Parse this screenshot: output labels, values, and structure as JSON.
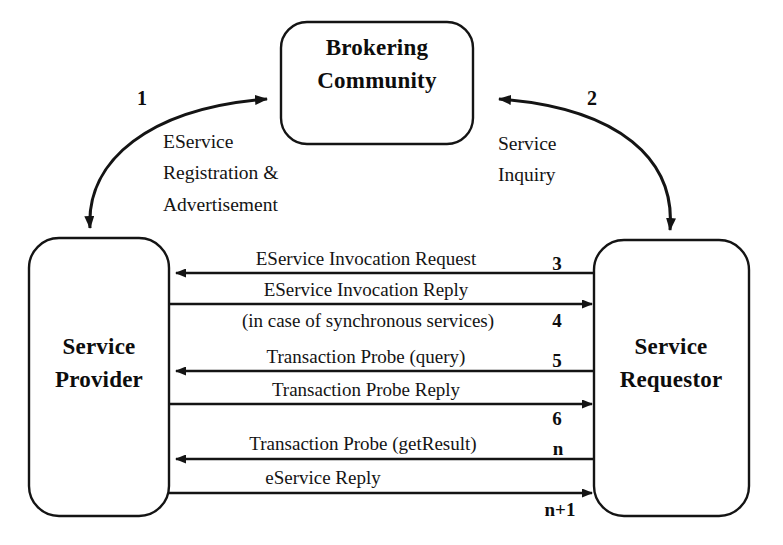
{
  "diagram": {
    "nodes": [
      {
        "id": "broker",
        "label_line1": "Brokering",
        "label_line2": "Community"
      },
      {
        "id": "provider",
        "label_line1": "Service",
        "label_line2": "Provider"
      },
      {
        "id": "requestor",
        "label_line1": "Service",
        "label_line2": "Requestor"
      }
    ],
    "curved_flows": [
      {
        "id": "registration",
        "number": "1",
        "label_lines": [
          "EService",
          "Registration &",
          "Advertisement"
        ],
        "from": "provider",
        "to": "broker",
        "double_headed": true
      },
      {
        "id": "inquiry",
        "number": "2",
        "label_lines": [
          "Service",
          "Inquiry"
        ],
        "from": "requestor",
        "to": "broker",
        "double_headed": true
      }
    ],
    "messages": [
      {
        "number": "3",
        "label": "EService Invocation Request",
        "sublabel": "",
        "direction": "right-to-left"
      },
      {
        "number": "4",
        "label": "EService Invocation Reply",
        "sublabel": "(in case of synchronous services)",
        "direction": "left-to-right"
      },
      {
        "number": "5",
        "label": "Transaction Probe (query)",
        "sublabel": "",
        "direction": "right-to-left"
      },
      {
        "number": "6",
        "label": "Transaction Probe Reply",
        "sublabel": "",
        "direction": "left-to-right"
      },
      {
        "number": "n",
        "label": "Transaction Probe (getResult)",
        "sublabel": "",
        "direction": "right-to-left"
      },
      {
        "number": "n+1",
        "label": "eService Reply",
        "sublabel": "",
        "direction": "left-to-right"
      }
    ],
    "colors": {
      "stroke": "#141414",
      "fill": "#ffffff",
      "text": "#0d0d0d"
    }
  }
}
